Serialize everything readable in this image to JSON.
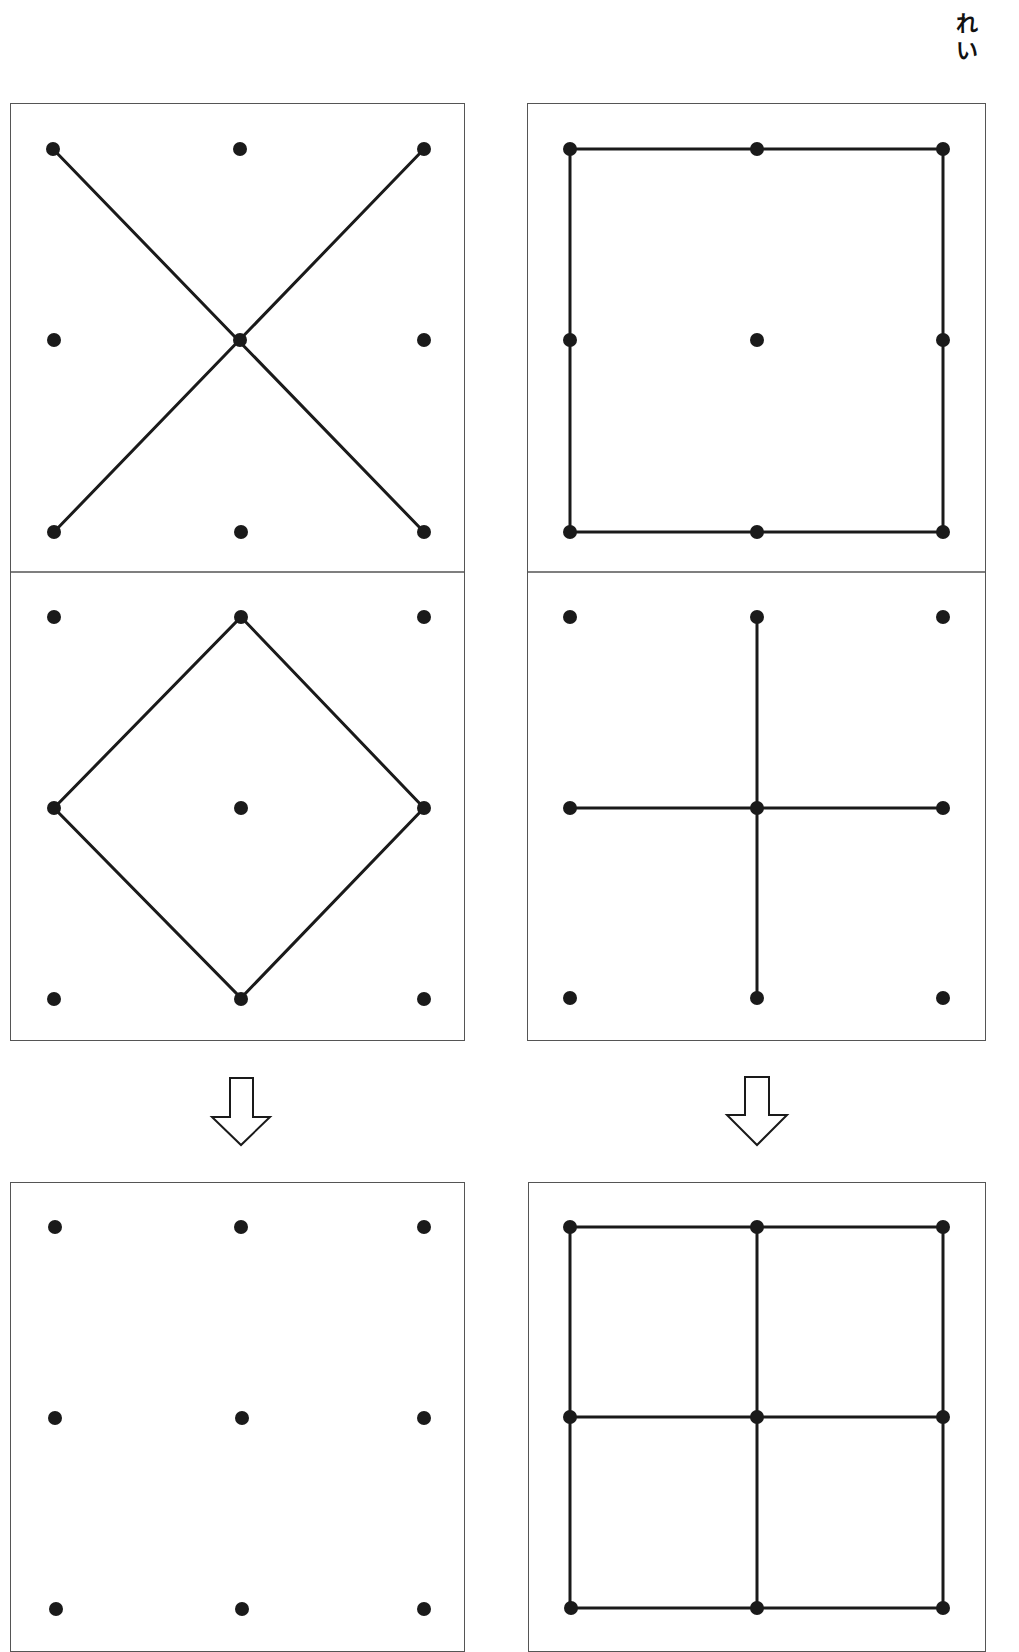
{
  "header": {
    "label": "れい",
    "label_chars": [
      "れ",
      "い"
    ]
  },
  "grid": {
    "description": "3x3 dot grid (geoboard) puzzles; coordinates are grid indices col,row 0..2",
    "dot_color": "#1a1a1a",
    "line_color": "#1a1a1a",
    "border_color": "#555555"
  },
  "columns": [
    {
      "name": "left",
      "top_panels": [
        {
          "name": "x-shape",
          "segments": [
            [
              [
                0,
                0
              ],
              [
                2,
                2
              ]
            ],
            [
              [
                2,
                0
              ],
              [
                0,
                2
              ]
            ]
          ]
        },
        {
          "name": "diamond",
          "segments": [
            [
              [
                1,
                0
              ],
              [
                2,
                1
              ]
            ],
            [
              [
                2,
                1
              ],
              [
                1,
                2
              ]
            ],
            [
              [
                1,
                2
              ],
              [
                0,
                1
              ]
            ],
            [
              [
                0,
                1
              ],
              [
                1,
                0
              ]
            ]
          ]
        }
      ],
      "arrow": "down-arrow",
      "result_panel": {
        "name": "answer-blank",
        "segments": []
      }
    },
    {
      "name": "right",
      "top_panels": [
        {
          "name": "square-outline",
          "segments": [
            [
              [
                0,
                0
              ],
              [
                2,
                0
              ]
            ],
            [
              [
                2,
                0
              ],
              [
                2,
                2
              ]
            ],
            [
              [
                2,
                2
              ],
              [
                0,
                2
              ]
            ],
            [
              [
                0,
                2
              ],
              [
                0,
                0
              ]
            ]
          ]
        },
        {
          "name": "plus-shape",
          "segments": [
            [
              [
                1,
                0
              ],
              [
                1,
                2
              ]
            ],
            [
              [
                0,
                1
              ],
              [
                2,
                1
              ]
            ]
          ]
        }
      ],
      "arrow": "down-arrow",
      "result_panel": {
        "name": "example-combined-grid",
        "segments": [
          [
            [
              0,
              0
            ],
            [
              2,
              0
            ]
          ],
          [
            [
              2,
              0
            ],
            [
              2,
              2
            ]
          ],
          [
            [
              2,
              2
            ],
            [
              0,
              2
            ]
          ],
          [
            [
              0,
              2
            ],
            [
              0,
              0
            ]
          ],
          [
            [
              1,
              0
            ],
            [
              1,
              2
            ]
          ],
          [
            [
              0,
              1
            ],
            [
              2,
              1
            ]
          ]
        ]
      }
    }
  ]
}
